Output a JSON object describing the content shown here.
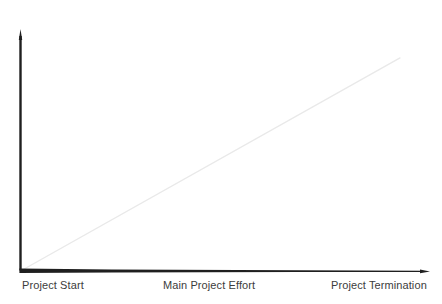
{
  "chart_data": {
    "type": "line",
    "title": "",
    "subtitle": "",
    "xlabel": "",
    "ylabel": "",
    "grid": false,
    "legend": false,
    "axis_arrows": {
      "x": "right",
      "y": "up"
    },
    "x_tick_labels": [
      "Project Start",
      "Main Project Effort",
      "Project Termination"
    ],
    "y_tick_labels": [],
    "xlim": [
      0,
      1
    ],
    "ylim": [
      0,
      1
    ],
    "series": [
      {
        "name": "Cumulative Project Effort",
        "type": "line",
        "color": "#e9e9e9",
        "x": [
          0,
          1
        ],
        "values": [
          0,
          0.88
        ]
      }
    ],
    "annotations": []
  },
  "axes": {
    "x_axis_color": "#1f1f1f",
    "y_axis_color": "#1f1f1f",
    "diagonal_color": "#e9e9e9",
    "label_color": "#3c3c3c"
  },
  "labels": {
    "start": "Project Start",
    "main_effort": "Main Project Effort",
    "termination": "Project Termination"
  },
  "icons": {
    "y_axis_arrow": "arrow-up-icon",
    "x_axis_arrow": "arrow-right-icon"
  }
}
